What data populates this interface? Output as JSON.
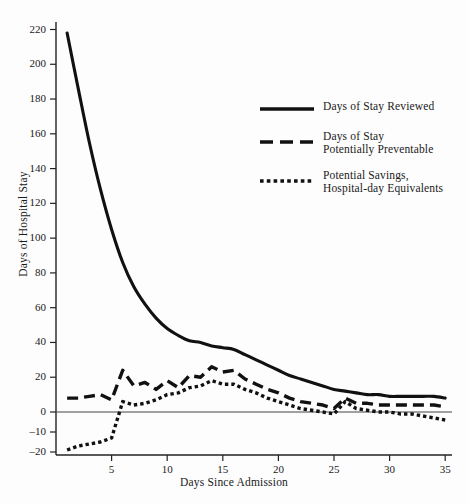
{
  "chart_data": {
    "type": "line",
    "title": "",
    "xlabel": "Days Since Admission",
    "ylabel": "Days of Hospital Stay",
    "xlim": [
      0,
      35.6
    ],
    "ylim": [
      -20,
      228
    ],
    "grid": false,
    "legend_position": "upper-right-inside",
    "xticks": [
      5,
      10,
      15,
      20,
      25,
      30,
      35
    ],
    "yticks": [
      -20,
      -10,
      0,
      20,
      40,
      60,
      80,
      100,
      120,
      140,
      160,
      180,
      200,
      220
    ],
    "zero_line": true,
    "y_axis_note": "Scale steps by 20 above zero and by 10 below zero",
    "series": [
      {
        "name": "Days of Stay Reviewed",
        "style": "solid",
        "x": [
          1,
          2,
          3,
          4,
          5,
          6,
          7,
          8,
          9,
          10,
          11,
          12,
          13,
          14,
          15,
          16,
          17,
          18,
          19,
          20,
          21,
          22,
          23,
          24,
          25,
          26,
          27,
          28,
          29,
          30,
          31,
          32,
          33,
          34,
          35
        ],
        "values": [
          218,
          186,
          155,
          128,
          105,
          86,
          72,
          62,
          54,
          48,
          44,
          41,
          40,
          38,
          37,
          36,
          33,
          30,
          27,
          24,
          21,
          19,
          17,
          15,
          13,
          12,
          11,
          10,
          10,
          9,
          9,
          9,
          9,
          9,
          8
        ]
      },
      {
        "name": "Days of Stay Potentially Preventable",
        "style": "dashed",
        "x": [
          1,
          2,
          3,
          4,
          5,
          6,
          7,
          8,
          9,
          10,
          11,
          12,
          13,
          14,
          15,
          16,
          17,
          18,
          19,
          20,
          21,
          22,
          23,
          24,
          25,
          26,
          27,
          28,
          29,
          30,
          31,
          32,
          33,
          34,
          35
        ],
        "values": [
          8,
          8,
          9,
          10,
          7,
          24,
          15,
          17,
          13,
          18,
          14,
          21,
          20,
          26,
          23,
          24,
          19,
          16,
          13,
          11,
          8,
          6,
          5,
          4,
          2,
          8,
          5,
          5,
          4,
          4,
          4,
          4,
          4,
          4,
          3
        ]
      },
      {
        "name": "Potential Savings, Hospital-day Equivalents",
        "style": "dotted",
        "x": [
          1,
          2,
          3,
          4,
          5,
          6,
          7,
          8,
          9,
          10,
          11,
          12,
          13,
          14,
          15,
          16,
          17,
          18,
          19,
          20,
          21,
          22,
          23,
          24,
          25,
          26,
          27,
          28,
          29,
          30,
          31,
          32,
          33,
          34,
          35
        ],
        "values": [
          -19,
          -17,
          -16,
          -15,
          -13,
          6,
          4,
          5,
          7,
          10,
          11,
          14,
          15,
          18,
          16,
          16,
          13,
          11,
          8,
          6,
          4,
          2,
          1,
          0,
          -1,
          6,
          2,
          1,
          0,
          0,
          -1,
          -1,
          -2,
          -3,
          -4
        ]
      }
    ]
  },
  "legend": {
    "items": [
      {
        "label_line1": "Days of Stay Reviewed",
        "label_line2": "",
        "style": "solid"
      },
      {
        "label_line1": "Days of Stay",
        "label_line2": "Potentially Preventable",
        "style": "dashed"
      },
      {
        "label_line1": "Potential Savings,",
        "label_line2": "Hospital-day Equivalents",
        "style": "dotted"
      }
    ]
  },
  "axes": {
    "x_title": "Days Since Admission",
    "y_title": "Days of Hospital Stay",
    "x_tick_labels": [
      "5",
      "10",
      "15",
      "20",
      "25",
      "30",
      "35"
    ],
    "y_tick_labels": [
      "220",
      "200",
      "180",
      "160",
      "140",
      "120",
      "100",
      "80",
      "60",
      "40",
      "20",
      "0",
      "–10",
      "–20"
    ]
  },
  "colors": {
    "line": "#111111",
    "axis": "#222222",
    "background": "#fdfdfd",
    "text": "#1a1a1a"
  }
}
